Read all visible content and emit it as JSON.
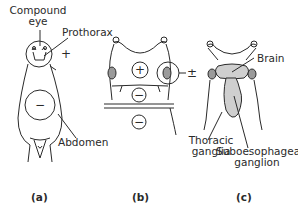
{
  "diagram": {
    "panels": [
      {
        "id": "a",
        "caption": "(a)",
        "labels": {
          "compound_eye_line1": "Compound",
          "compound_eye_line2": "eye",
          "prothorax": "Prothorax",
          "abdomen": "Abdomen"
        },
        "signs": {
          "head": "+",
          "abdomen": "−"
        }
      },
      {
        "id": "b",
        "caption": "(b)",
        "signs": {
          "thorax": "+",
          "eye": "±",
          "segment1": "−",
          "segment2": "−"
        }
      },
      {
        "id": "c",
        "caption": "(c)",
        "labels": {
          "brain": "Brain",
          "thoracic_line1": "Thoracic",
          "thoracic_line2": "ganglia",
          "suboeso_line1": "Suboesophageal",
          "suboeso_line2": "ganglion"
        }
      }
    ],
    "colors": {
      "line": "#2a2a2a",
      "ganglion_fill": "#cfcfcf",
      "eye_fill": "#9a9a9a",
      "background": "#ffffff"
    }
  }
}
